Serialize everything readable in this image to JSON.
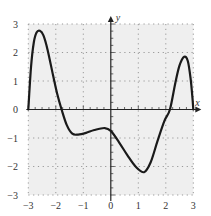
{
  "chart_data": {
    "type": "line",
    "title": "",
    "xlabel": "x",
    "ylabel": "y",
    "xlim": [
      -3,
      3
    ],
    "ylim": [
      -3,
      3
    ],
    "grid": true,
    "grid_style": "dotted",
    "x_ticks": [
      -3,
      -2,
      -1,
      0,
      1,
      2,
      3
    ],
    "y_ticks": [
      -3,
      -2,
      -1,
      0,
      1,
      2,
      3
    ],
    "x_tick_labels": [
      "−3",
      "−2",
      "−1",
      "0",
      "1",
      "2",
      "3"
    ],
    "y_tick_labels": [
      "−3",
      "−2",
      "−1",
      "0",
      "1",
      "2",
      "3"
    ],
    "legend": [],
    "series": [
      {
        "name": "f(x)",
        "color": "#1a1a1a",
        "x": [
          -3.0,
          -2.9,
          -2.8,
          -2.7,
          -2.58,
          -2.45,
          -2.3,
          -2.1,
          -1.95,
          -1.79,
          -1.6,
          -1.4,
          -1.19,
          -0.9,
          -0.6,
          -0.22,
          0.0,
          0.3,
          0.6,
          0.9,
          1.21,
          1.45,
          1.7,
          1.95,
          2.15,
          2.35,
          2.5,
          2.67,
          2.8,
          2.9,
          2.97,
          3.0
        ],
        "y": [
          0.0,
          1.5,
          2.35,
          2.7,
          2.76,
          2.6,
          2.1,
          1.2,
          0.55,
          0.0,
          -0.55,
          -0.85,
          -0.88,
          -0.82,
          -0.72,
          -0.65,
          -0.75,
          -1.15,
          -1.6,
          -2.0,
          -2.2,
          -1.85,
          -1.1,
          -0.4,
          0.0,
          0.95,
          1.55,
          1.85,
          1.7,
          1.1,
          0.4,
          0.0
        ]
      }
    ]
  },
  "labels": {
    "x_axis": "x",
    "y_axis": "y"
  }
}
